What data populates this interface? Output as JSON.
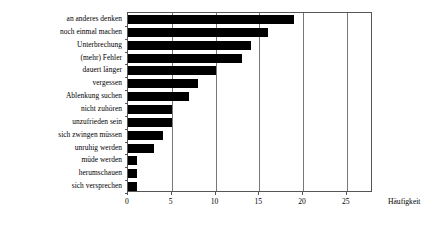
{
  "chart_data": {
    "type": "bar",
    "orientation": "horizontal",
    "title": "",
    "subtitle": "",
    "xlabel": "Häufigkeit",
    "ylabel": "",
    "xlim": [
      0,
      28
    ],
    "xticks": [
      0,
      5,
      10,
      15,
      20,
      25
    ],
    "xtick_labels": [
      "0",
      "5",
      "10",
      "15",
      "20",
      "25"
    ],
    "grid": "vertical",
    "legend": null,
    "bar_color": "#000000",
    "categories": [
      "an anderes denken",
      "noch einmal machen",
      "Unterbrechung",
      "(mehr) Fehler",
      "dauert länger",
      "vergessen",
      "Ablenkung suchen",
      "nicht zuhören",
      "unzufrieden sein",
      "sich zwingen müssen",
      "unruhig werden",
      "müde werden",
      "herumschauen",
      "sich versprechen"
    ],
    "values": [
      19,
      16,
      14,
      13,
      10,
      8,
      7,
      5,
      5,
      4,
      3,
      1,
      1,
      1
    ]
  },
  "axis": {
    "x_title": "Häufigkeit"
  },
  "colors": {
    "bar": "#000000",
    "frame": "#555555",
    "gridline": "#777777",
    "background": "#ffffff"
  }
}
